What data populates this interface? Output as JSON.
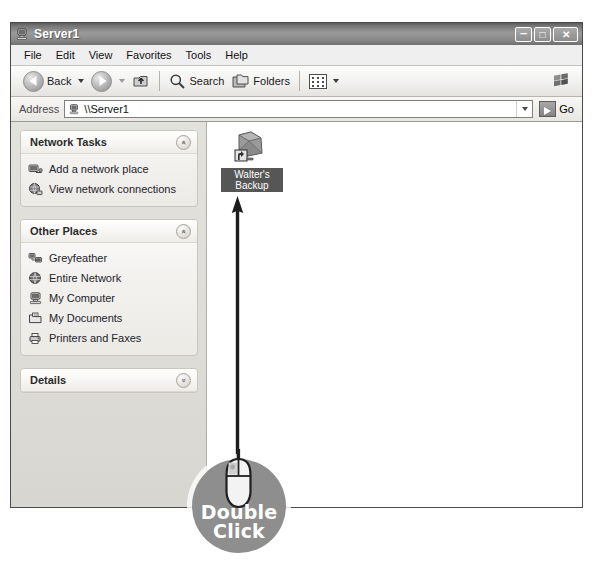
{
  "window": {
    "title": "Server1",
    "titlebar_icon": "computer-icon",
    "controls": [
      {
        "name": "minimize-button",
        "glyph": "–"
      },
      {
        "name": "maximize-button",
        "glyph": "□"
      },
      {
        "name": "close-button",
        "glyph": "✕"
      }
    ]
  },
  "menu": {
    "items": [
      "File",
      "Edit",
      "View",
      "Favorites",
      "Tools",
      "Help"
    ]
  },
  "toolbar": {
    "back_label": "Back",
    "forward_label": "",
    "up_label": "",
    "search_label": "Search",
    "folders_label": "Folders",
    "views_label": "",
    "brand_icon": "windows-flag-icon"
  },
  "address": {
    "label": "Address",
    "value": "\\\\Server1",
    "icon": "computer-icon",
    "go_label": "Go"
  },
  "sidebar": {
    "panels": [
      {
        "title": "Network Tasks",
        "collapse_glyph": "«",
        "state": "expanded",
        "items": [
          {
            "label": "Add a network place",
            "icon": "add-network-place-icon"
          },
          {
            "label": "View network connections",
            "icon": "network-connections-icon"
          }
        ]
      },
      {
        "title": "Other Places",
        "collapse_glyph": "«",
        "state": "expanded",
        "items": [
          {
            "label": "Greyfeather",
            "icon": "workgroup-icon"
          },
          {
            "label": "Entire Network",
            "icon": "globe-network-icon"
          },
          {
            "label": "My Computer",
            "icon": "my-computer-icon"
          },
          {
            "label": "My Documents",
            "icon": "my-documents-icon"
          },
          {
            "label": "Printers and Faxes",
            "icon": "printers-and-faxes-icon"
          }
        ]
      },
      {
        "title": "Details",
        "collapse_glyph": "»",
        "state": "collapsed",
        "items": []
      }
    ]
  },
  "content": {
    "items": [
      {
        "label": "Walter's Backup",
        "icon": "shared-folder-icon",
        "selected": true
      }
    ]
  },
  "annotation": {
    "badge_line1": "Double",
    "badge_line2": "Click",
    "mouse_icon": "computer-mouse-icon",
    "arrow_icon": "up-arrow-annotation",
    "badge_color": "#8e8e8e",
    "text_color": "#ffffff"
  }
}
